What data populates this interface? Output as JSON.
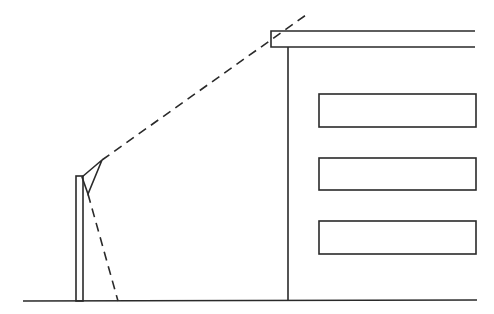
{
  "diagram": {
    "stroke_color": "#2a2a2a",
    "background": "#ffffff",
    "ground": {
      "x1": 23,
      "y1": 301,
      "x2": 477,
      "y2": 300
    },
    "pole": {
      "x": 76,
      "y": 176,
      "width": 7,
      "height": 125
    },
    "camera": {
      "points": "82,177 102,160 88,194"
    },
    "view_lines": [
      {
        "x1": 102,
        "y1": 160,
        "x2": 306,
        "y2": 15
      },
      {
        "x1": 88,
        "y1": 194,
        "x2": 118,
        "y2": 301
      }
    ],
    "building": {
      "roof": {
        "x": 271,
        "y": 31,
        "width": 204,
        "height": 16
      },
      "wall": {
        "x": 288,
        "y1": 47,
        "y2": 300
      },
      "windows": [
        {
          "x": 319,
          "y": 94,
          "width": 157,
          "height": 33
        },
        {
          "x": 319,
          "y": 158,
          "width": 157,
          "height": 32
        },
        {
          "x": 319,
          "y": 221,
          "width": 157,
          "height": 33
        }
      ]
    }
  }
}
